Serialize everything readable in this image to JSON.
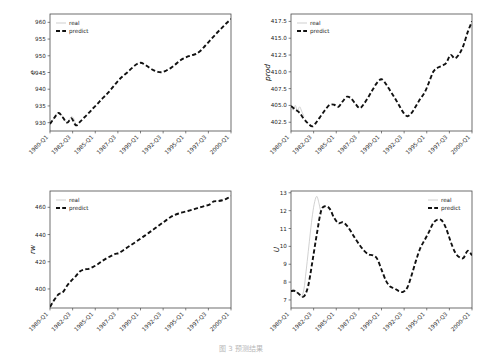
{
  "figure": {
    "caption": "图 3 预测结果",
    "legend": {
      "real_label": "real",
      "predict_label": "predict"
    },
    "colors": {
      "real": "#c9c9c9",
      "predict": "#111111",
      "axis": "#4a4a4a",
      "background": "#ffffff"
    }
  },
  "chart_data": [
    {
      "id": "e",
      "type": "line",
      "title": "",
      "xlabel": "",
      "ylabel": "e",
      "legend_position": "upper left",
      "grid": false,
      "xticklabels": [
        "1980-Q1",
        "1982-Q3",
        "1985-Q1",
        "1987-Q3",
        "1990-Q1",
        "1992-Q3",
        "1995-Q1",
        "1997-Q3",
        "2000-Q1"
      ],
      "yticklabels": [
        "930",
        "935",
        "940",
        "945",
        "950",
        "955",
        "960"
      ],
      "ylim": [
        927.5,
        962.5
      ],
      "xlim": [
        0,
        84
      ],
      "series": [
        {
          "name": "real",
          "x": [
            0,
            1,
            2,
            3,
            4,
            5,
            6,
            7,
            8,
            9,
            10,
            11,
            12
          ],
          "values": [
            929.6,
            930.4,
            931.6,
            932.6,
            933.0,
            932.6,
            931.6,
            930.6,
            930.0,
            930.9,
            931.8,
            931.2,
            929.4
          ]
        },
        {
          "name": "predict",
          "x": [
            0,
            2,
            4,
            6,
            8,
            10,
            12,
            14,
            16,
            18,
            20,
            22,
            24,
            26,
            28,
            30,
            32,
            34,
            36,
            38,
            40,
            42,
            44,
            46,
            48,
            50,
            52,
            54,
            56,
            58,
            60,
            62,
            64,
            66,
            68,
            70,
            72,
            74,
            76,
            78,
            80,
            82,
            84
          ],
          "values": [
            929.6,
            931.4,
            932.9,
            931.5,
            930.0,
            931.3,
            929.2,
            930.3,
            931.6,
            932.9,
            934.3,
            935.6,
            937.0,
            938.3,
            939.7,
            941.3,
            942.8,
            944.0,
            945.1,
            946.3,
            947.4,
            947.9,
            947.4,
            946.5,
            945.7,
            945.2,
            945.1,
            945.6,
            946.3,
            947.3,
            948.4,
            949.2,
            949.8,
            950.2,
            950.6,
            951.6,
            953.0,
            954.4,
            955.8,
            957.2,
            958.5,
            959.8,
            961.0
          ]
        }
      ]
    },
    {
      "id": "prod",
      "type": "line",
      "title": "",
      "xlabel": "",
      "ylabel": "prod",
      "legend_position": "upper left",
      "grid": false,
      "xticklabels": [
        "1980-Q1",
        "1982-Q3",
        "1985-Q1",
        "1987-Q3",
        "1990-Q1",
        "1992-Q3",
        "1995-Q1",
        "1997-Q3",
        "2000-Q1"
      ],
      "yticklabels": [
        "402.5",
        "405.0",
        "407.5",
        "410.0",
        "412.5",
        "415.0",
        "417.5"
      ],
      "ylim": [
        401.2,
        418.6
      ],
      "xlim": [
        0,
        84
      ],
      "series": [
        {
          "name": "real",
          "x": [
            0,
            1,
            2,
            3,
            4,
            5,
            6
          ],
          "values": [
            404.9,
            404.3,
            405.0,
            404.2,
            404.8,
            404.1,
            403.4
          ]
        },
        {
          "name": "predict",
          "x": [
            0,
            2,
            4,
            6,
            8,
            10,
            12,
            14,
            16,
            18,
            20,
            22,
            24,
            26,
            28,
            30,
            32,
            34,
            36,
            38,
            40,
            42,
            44,
            46,
            48,
            50,
            52,
            54,
            56,
            58,
            60,
            62,
            64,
            66,
            68,
            70,
            72,
            74,
            76,
            78,
            80,
            82,
            84
          ],
          "values": [
            404.9,
            404.4,
            403.9,
            403.0,
            402.3,
            401.9,
            402.6,
            403.5,
            404.4,
            405.1,
            405.1,
            404.8,
            405.6,
            406.3,
            406.0,
            405.2,
            404.6,
            405.3,
            406.3,
            407.4,
            408.4,
            408.9,
            408.2,
            407.2,
            406.2,
            405.1,
            404.0,
            403.4,
            403.9,
            404.9,
            406.0,
            406.9,
            408.4,
            410.0,
            410.6,
            410.9,
            411.3,
            412.5,
            412.0,
            412.6,
            413.9,
            415.9,
            417.5
          ]
        }
      ]
    },
    {
      "id": "rw",
      "type": "line",
      "title": "",
      "xlabel": "",
      "ylabel": "rw",
      "legend_position": "upper left",
      "grid": false,
      "xticklabels": [
        "1980-Q1",
        "1982-Q3",
        "1985-Q1",
        "1987-Q3",
        "1990-Q1",
        "1992-Q3",
        "1995-Q1",
        "1997-Q3",
        "2000-Q1"
      ],
      "yticklabels": [
        "400",
        "420",
        "440",
        "460"
      ],
      "ylim": [
        386,
        472
      ],
      "xlim": [
        0,
        84
      ],
      "series": [
        {
          "name": "real",
          "x": [
            0,
            1,
            2,
            3,
            4,
            5
          ],
          "values": [
            386.8,
            389.5,
            392.0,
            394.2,
            396.0,
            397.4
          ]
        },
        {
          "name": "predict",
          "x": [
            0,
            2,
            4,
            6,
            8,
            10,
            12,
            14,
            16,
            18,
            20,
            22,
            24,
            26,
            28,
            30,
            32,
            34,
            36,
            38,
            40,
            42,
            44,
            46,
            48,
            50,
            52,
            54,
            56,
            58,
            60,
            62,
            64,
            66,
            68,
            70,
            72,
            74,
            76,
            78,
            80,
            82,
            84
          ],
          "values": [
            386.8,
            392.0,
            396.1,
            397.7,
            402.5,
            406.3,
            409.5,
            413.0,
            414.4,
            414.8,
            416.2,
            418.0,
            420.3,
            422.3,
            424.0,
            425.6,
            426.4,
            428.5,
            430.6,
            432.7,
            434.8,
            437.0,
            439.2,
            441.4,
            443.7,
            446.0,
            448.3,
            450.6,
            452.9,
            454.5,
            455.6,
            456.5,
            457.3,
            458.2,
            459.2,
            460.2,
            461.1,
            462.0,
            464.3,
            464.6,
            465.2,
            466.4,
            468.2
          ]
        }
      ]
    },
    {
      "id": "U",
      "type": "line",
      "title": "",
      "xlabel": "",
      "ylabel": "U",
      "legend_position": "upper right",
      "grid": false,
      "xticklabels": [
        "1980-Q1",
        "1982-Q3",
        "1985-Q1",
        "1987-Q3",
        "1990-Q1",
        "1992-Q3",
        "1995-Q1",
        "1997-Q3",
        "2000-Q1"
      ],
      "yticklabels": [
        "7",
        "8",
        "9",
        "10",
        "11",
        "12",
        "13"
      ],
      "ylim": [
        6.55,
        13.1
      ],
      "xlim": [
        0,
        84
      ],
      "series": [
        {
          "name": "real",
          "x": [
            0,
            1,
            2,
            3,
            4,
            5,
            6,
            7,
            8,
            9,
            10,
            11,
            12,
            13,
            14
          ],
          "values": [
            7.5,
            7.6,
            7.5,
            7.4,
            7.3,
            7.2,
            7.6,
            8.6,
            9.7,
            10.8,
            11.8,
            12.5,
            12.8,
            12.4,
            11.8
          ]
        },
        {
          "name": "predict",
          "x": [
            0,
            2,
            4,
            6,
            8,
            10,
            12,
            14,
            16,
            18,
            20,
            22,
            24,
            26,
            28,
            30,
            32,
            34,
            36,
            38,
            40,
            42,
            44,
            46,
            48,
            50,
            52,
            54,
            56,
            58,
            60,
            62,
            64,
            66,
            68,
            70,
            72,
            74,
            76,
            78,
            80,
            82,
            84
          ],
          "values": [
            7.5,
            7.5,
            7.3,
            7.2,
            7.8,
            9.2,
            10.7,
            12.0,
            12.25,
            12.1,
            11.6,
            11.3,
            11.35,
            11.15,
            10.8,
            10.4,
            10.05,
            9.75,
            9.55,
            9.5,
            9.3,
            8.7,
            8.1,
            7.75,
            7.65,
            7.5,
            7.45,
            7.7,
            8.4,
            9.2,
            9.9,
            10.35,
            10.8,
            11.3,
            11.5,
            11.45,
            11.0,
            10.3,
            9.7,
            9.4,
            9.35,
            9.75,
            9.5,
            9.0,
            8.5,
            8.0,
            7.5,
            7.0,
            6.8,
            6.9
          ]
        }
      ]
    }
  ]
}
